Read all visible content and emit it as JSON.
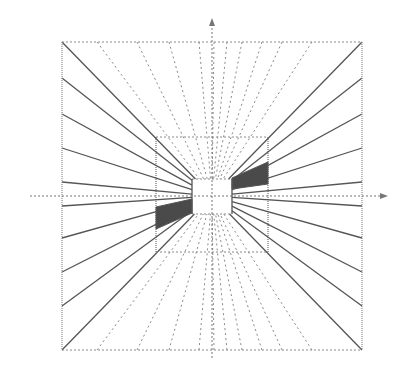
{
  "diagram": {
    "title": "",
    "type": "one-point perspective grid",
    "colors": {
      "background": "#ffffff",
      "solid_line": "#555555",
      "dotted_line": "#8a8a8a",
      "axis": "#777777",
      "shade": "#4a4a4a"
    },
    "vanishing_point": [
      212,
      196
    ],
    "outer_square": {
      "x1": 62,
      "y1": 42,
      "x2": 362,
      "y2": 350
    },
    "middle_rect": {
      "x1": 156,
      "y1": 137,
      "x2": 268,
      "y2": 252
    },
    "inner_rect": {
      "x1": 192,
      "y1": 179,
      "x2": 232,
      "y2": 214
    },
    "axes": {
      "horizontal": {
        "y": 196,
        "x_start": 30,
        "x_end": 388
      },
      "vertical": {
        "x": 212,
        "y_start": 18,
        "y_end": 360
      }
    },
    "left_wall_rays_y": [
      42,
      78,
      114,
      148,
      182,
      206,
      238,
      272,
      306,
      350
    ],
    "right_wall_rays_y": [
      42,
      78,
      114,
      148,
      182,
      206,
      238,
      272,
      306,
      350
    ],
    "ceiling_rays_x": [
      97,
      137,
      169,
      199,
      214,
      227,
      242,
      262,
      282,
      312
    ],
    "floor_rays_x": [
      97,
      137,
      169,
      199,
      214,
      227,
      242,
      262,
      282,
      312
    ],
    "shaded_regions": [
      {
        "name": "left-wall-panel",
        "points": [
          [
            156,
            207
          ],
          [
            192,
            199
          ],
          [
            192,
            213
          ],
          [
            156,
            229
          ]
        ]
      },
      {
        "name": "right-wall-panel",
        "points": [
          [
            232,
            178
          ],
          [
            268,
            162
          ],
          [
            268,
            184
          ],
          [
            232,
            189
          ]
        ]
      }
    ]
  }
}
